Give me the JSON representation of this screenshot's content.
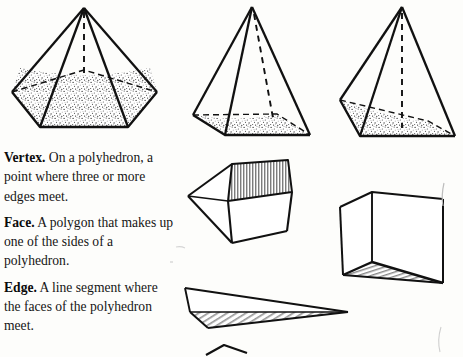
{
  "page": {
    "background_color": "#fdfdfb",
    "ink_color": "#1a1a1a",
    "width": 463,
    "height": 357
  },
  "glossary": {
    "entries": [
      {
        "term": "Vertex.",
        "definition": "On a polyhedron, a point where three or more edges meet."
      },
      {
        "term": "Face.",
        "definition": "A polygon that makes up one of the sides of a polyhedron."
      },
      {
        "term": "Edge.",
        "definition": "A line segment where the faces of the polyhedron meet."
      }
    ]
  },
  "figures": [
    {
      "name": "pentagonal-pyramid-with-sand",
      "description": "Pentagonal pyramid, partially filled with stippled sand, vertical dashed height line from apex",
      "fill_texture": "stipple",
      "has_dashed_height": true
    },
    {
      "name": "square-pyramid-with-sand-left",
      "description": "Square pyramid in perspective, shallow stippled sand layer, dashed height line",
      "fill_texture": "stipple",
      "has_dashed_height": true
    },
    {
      "name": "square-pyramid-with-sand-right",
      "description": "Square pyramid in perspective, stippled sand layer, vertical dashed height line",
      "fill_texture": "stipple",
      "has_dashed_height": true
    },
    {
      "name": "open-top-cube",
      "description": "Open-topped cube tilted in perspective with vertical hatching on inner walls",
      "fill_texture": "vertical-hatch",
      "has_dashed_height": false
    },
    {
      "name": "triangular-prism-wedge",
      "description": "Triangular prism wedge with diagonal hatching on the lower face",
      "fill_texture": "diagonal-hatch",
      "has_dashed_height": false
    },
    {
      "name": "thin-tetrahedron-wedge",
      "description": "Long thin tetrahedral wedge with diagonal hatching along the underside",
      "fill_texture": "diagonal-hatch",
      "has_dashed_height": false
    },
    {
      "name": "partial-shape-bottom",
      "description": "Partial outline of a shape cropped by the bottom page edge",
      "fill_texture": "none",
      "has_dashed_height": false
    },
    {
      "name": "stray-pencil-mark-right",
      "description": "Faint stray pencil mark near the right margin",
      "fill_texture": "none",
      "has_dashed_height": false
    }
  ]
}
